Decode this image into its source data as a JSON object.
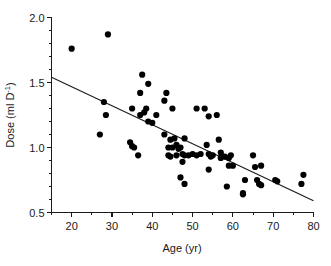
{
  "chart_data": {
    "type": "scatter",
    "title": "",
    "xlabel": "Age (yr)",
    "ylabel": "Dose (ml D",
    "ylabel_sup": "-1",
    "ylabel_tail": ")",
    "xlim": [
      15,
      80
    ],
    "ylim": [
      0.5,
      2.0
    ],
    "grid": false,
    "legend": "none",
    "x_ticks": [
      20,
      30,
      40,
      50,
      60,
      70,
      80
    ],
    "x_tick_labels": [
      "20",
      "30",
      "40",
      "50",
      "60",
      "70",
      "80"
    ],
    "x_minor_ticks": [
      15,
      25,
      35,
      45,
      55,
      65,
      75
    ],
    "y_ticks": [
      0.5,
      1.0,
      1.5,
      2.0
    ],
    "y_tick_labels": [
      "0.5",
      "1.0",
      "1.5",
      "2.0"
    ],
    "y_minor_ticks": [
      0.6,
      0.7,
      0.8,
      0.9,
      1.1,
      1.2,
      1.3,
      1.4,
      1.6,
      1.7,
      1.8,
      1.9
    ],
    "marker": "filled-circle",
    "marker_color": "#000000",
    "marker_size_px": 3.1,
    "fit_line": {
      "label": "linear regression",
      "color": "#1a1a1a",
      "x_start": 15,
      "y_start": 1.54,
      "x_end": 80,
      "y_end": 0.59
    },
    "x": [
      20,
      27,
      28,
      28.5,
      29,
      34.5,
      35,
      35,
      35.5,
      36.5,
      37,
      37,
      37.5,
      38,
      38.5,
      39,
      39,
      40,
      41,
      43,
      43,
      43.5,
      44,
      44,
      44.5,
      44.5,
      45,
      45,
      45.5,
      46,
      46,
      46.5,
      47,
      47,
      47.5,
      47.5,
      48,
      48,
      48,
      49,
      50,
      51,
      51,
      52,
      53,
      53.5,
      54,
      54,
      54,
      54.5,
      55,
      56,
      56.5,
      57,
      57,
      58,
      58.5,
      59,
      59,
      59.5,
      60,
      62.5,
      62.5,
      63,
      65,
      65.5,
      66,
      66.5,
      67,
      67,
      70.5,
      71,
      77,
      77.5
    ],
    "y": [
      1.76,
      1.1,
      1.35,
      1.25,
      1.87,
      1.04,
      1.3,
      1.01,
      1.0,
      0.94,
      1.42,
      1.25,
      1.56,
      1.27,
      1.3,
      1.49,
      1.2,
      1.19,
      1.25,
      1.36,
      1.1,
      1.42,
      1.0,
      0.94,
      1.06,
      0.93,
      1.3,
      1.0,
      1.07,
      1.02,
      0.94,
      0.99,
      1.0,
      0.77,
      0.95,
      0.89,
      1.07,
      0.94,
      0.72,
      0.94,
      0.95,
      1.3,
      0.94,
      0.95,
      1.3,
      1.02,
      1.24,
      0.95,
      0.83,
      0.93,
      0.94,
      1.25,
      1.06,
      0.96,
      0.92,
      0.93,
      0.7,
      0.92,
      0.86,
      0.94,
      0.86,
      0.65,
      0.64,
      0.75,
      0.94,
      0.85,
      0.75,
      0.72,
      0.86,
      0.71,
      0.75,
      0.74,
      0.72,
      0.79
    ],
    "n_points": 74
  }
}
